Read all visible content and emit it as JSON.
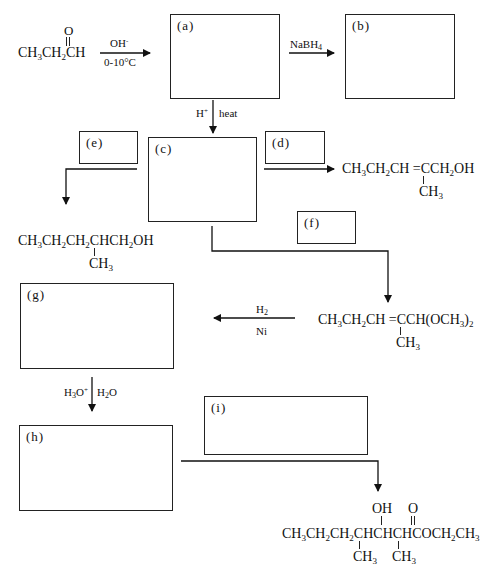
{
  "header": {
    "cut_off_text": "Supply the missing reagents and/or structures in the following synthetic scheme in the boxes provided."
  },
  "start_material": {
    "main": "CH3CH2CH",
    "carbonyl_O": "O"
  },
  "reagents": {
    "r1_top": "OH-",
    "r1_bottom": "0-10°C",
    "r2_top": "NaBH4",
    "r3_left": "H+",
    "r3_right": "heat",
    "r4_top": "H2",
    "r4_bottom": "Ni",
    "r5_left": "H3O+",
    "r5_right": "H2O"
  },
  "boxes": [
    {
      "id": "a",
      "label": "(a)"
    },
    {
      "id": "b",
      "label": "(b)"
    },
    {
      "id": "c",
      "label": "(c)"
    },
    {
      "id": "d",
      "label": "(d)"
    },
    {
      "id": "e",
      "label": "(e)"
    },
    {
      "id": "f",
      "label": "(f)"
    },
    {
      "id": "g",
      "label": "(g)"
    },
    {
      "id": "h",
      "label": "(h)"
    },
    {
      "id": "i",
      "label": "(i)"
    }
  ],
  "products": {
    "d_product": {
      "main": "CH3CH2CH =CCH2OH",
      "substituent": "CH3"
    },
    "e_product": {
      "main": "CH3CH2CH2CHCH2OH",
      "substituent": "CH3"
    },
    "f_product": {
      "main": "CH3CH2CH =CCH(OCH3)2",
      "substituent": "CH3"
    },
    "i_product": {
      "main": "CH3CH2CH2CHCHCHCOCH2CH3",
      "hydroxyl": "OH",
      "carbonyl_O": "O",
      "substituent_1": "CH3",
      "substituent_2": "CH3"
    }
  }
}
